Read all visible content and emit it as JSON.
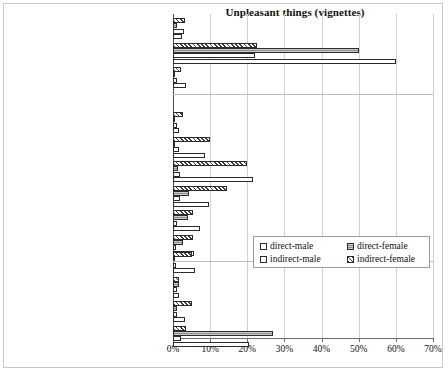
{
  "chart_data": {
    "type": "bar",
    "orientation": "horizontal",
    "title": "Unpleasant things (vignettes)",
    "xlabel": "",
    "ylabel": "",
    "xlim": [
      0,
      70
    ],
    "xtick_labels": [
      "0%",
      "10%",
      "20%",
      "30%",
      "40%",
      "50%",
      "60%",
      "70%"
    ],
    "xticks": [
      0,
      10,
      20,
      30,
      40,
      50,
      60,
      70
    ],
    "grid": true,
    "legend_position": "center-right",
    "series_order_top_to_bottom": [
      "indirect-female",
      "direct-female",
      "indirect-male",
      "direct-male"
    ],
    "series": [
      {
        "name": "direct-male",
        "key": "dm",
        "pattern": "open-white"
      },
      {
        "name": "direct-female",
        "key": "df",
        "pattern": "solid-gray"
      },
      {
        "name": "indirect-male",
        "key": "im",
        "pattern": "open-white"
      },
      {
        "name": "indirect-female",
        "key": "if",
        "pattern": "diagonal-hatch"
      }
    ],
    "groups": [
      {
        "name": "summary",
        "categories": [
          "dk/ na",
          "no",
          "various"
        ],
        "values": {
          "dk/ na": {
            "dm": 2.3,
            "df": 1.2,
            "im": 3.0,
            "if": 3.3
          },
          "no": {
            "dm": 60.0,
            "df": 50.0,
            "im": 22.0,
            "if": 22.5
          },
          "various": {
            "dm": 3.4,
            "df": 0.4,
            "im": 1.0,
            "if": 2.1
          }
        }
      },
      {
        "name": "incident-types",
        "categories": [
          "pickpocketing/ purse snatching",
          "vandalism",
          "booing/ calling names",
          "pushing/pulling",
          "physical violence",
          "threat"
        ],
        "values": {
          "pickpocketing/ purse snatching": {
            "dm": 1.6,
            "df": 0.5,
            "im": 1.1,
            "if": 2.6
          },
          "vandalism": {
            "dm": 8.6,
            "df": 0.6,
            "im": 1.5,
            "if": 10.0
          },
          "booing/ calling names": {
            "dm": 21.5,
            "df": 1.4,
            "im": 1.8,
            "if": 19.8
          },
          "pushing/pulling": {
            "dm": 9.8,
            "df": 4.3,
            "im": 2.0,
            "if": 14.6
          },
          "physical violence": {
            "dm": 7.2,
            "df": 4.0,
            "im": 1.1,
            "if": 5.5
          },
          "threat": {
            "dm": 5.7,
            "df": 2.6,
            "im": 0.9,
            "if": 5.3
          }
        }
      },
      {
        "name": "other-behaviour",
        "categories": [
          "unspecified disturbing behaviour",
          "other",
          "drugs-related",
          "being approached/ harassed"
        ],
        "values": {
          "unspecified disturbing behaviour": {
            "dm": 6.0,
            "df": 0.5,
            "im": 0.8,
            "if": 5.0
          },
          "other": {
            "dm": 1.6,
            "df": 1.6,
            "im": 1.0,
            "if": 1.6
          },
          "drugs-related": {
            "dm": 3.1,
            "df": 1.0,
            "im": 1.0,
            "if": 5.0
          },
          "being approached/ harassed": {
            "dm": 20.5,
            "df": 27.0,
            "im": 2.2,
            "if": 3.6
          }
        }
      }
    ]
  },
  "legend": {
    "items": [
      {
        "label": "direct-male",
        "key": "dm"
      },
      {
        "label": "direct-female",
        "key": "df"
      },
      {
        "label": "indirect-male",
        "key": "im"
      },
      {
        "label": "indirect-female",
        "key": "if"
      }
    ]
  }
}
